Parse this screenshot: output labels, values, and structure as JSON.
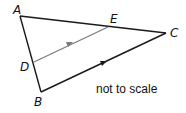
{
  "figure": {
    "type": "triangle-with-parallel-segment",
    "points": {
      "A": {
        "label": "A",
        "x": 20,
        "y": 16
      },
      "B": {
        "label": "B",
        "x": 41,
        "y": 92
      },
      "C": {
        "label": "C",
        "x": 166,
        "y": 33
      },
      "D": {
        "label": "D",
        "x": 34,
        "y": 62
      },
      "E": {
        "label": "E",
        "x": 108,
        "y": 27
      }
    },
    "segments": [
      "AB",
      "AC",
      "BC",
      "DE"
    ],
    "parallel_marks": [
      "DE",
      "BC"
    ],
    "note": "not to scale",
    "colors": {
      "main_line": "#1a1a1a",
      "de_line": "#7a7a7a",
      "text": "#111111"
    }
  }
}
